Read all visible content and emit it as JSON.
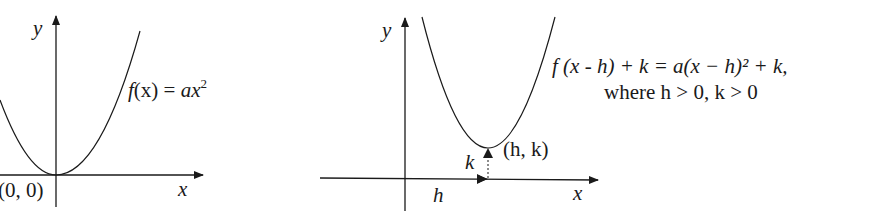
{
  "left_diagram": {
    "y_axis_label": "y",
    "x_axis_label": "x",
    "vertex_label": "(0, 0)",
    "function_label": {
      "f": "f",
      "arg": "(x)",
      "eq": " = ",
      "rhs": "ax",
      "exp": "2"
    }
  },
  "right_diagram": {
    "y_axis_label": "y",
    "x_axis_label": "x",
    "vertex_label": "(h, k)",
    "h_label": "h",
    "k_label": "k",
    "function_label_line1": "f (x - h) + k = a(x − h)² + k,",
    "function_label_line2": "where h > 0, k > 0"
  },
  "colors": {
    "stroke": "#1a1a1a",
    "background": "#ffffff"
  }
}
